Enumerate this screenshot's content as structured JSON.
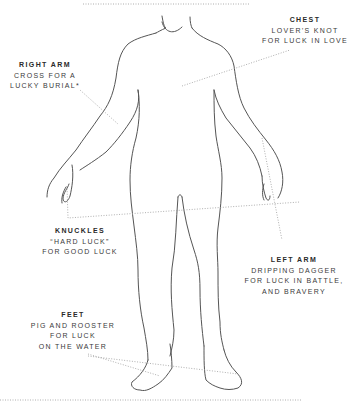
{
  "diagram": {
    "annotations": [
      {
        "id": "chest",
        "title": "CHEST",
        "lines": [
          "LOVER’S KNOT",
          "FOR LUCK IN LOVE"
        ]
      },
      {
        "id": "right-arm",
        "title": "RIGHT ARM",
        "lines": [
          "CROSS FOR A",
          "LUCKY BURIAL*"
        ]
      },
      {
        "id": "knuckles",
        "title": "KNUCKLES",
        "lines": [
          "“HARD LUCK”",
          "FOR GOOD LUCK"
        ]
      },
      {
        "id": "left-arm",
        "title": "LEFT ARM",
        "lines": [
          "DRIPPING DAGGER",
          "FOR LUCK IN BATTLE,",
          "AND BRAVERY"
        ]
      },
      {
        "id": "feet",
        "title": "FEET",
        "lines": [
          "PIG AND ROOSTER",
          "FOR LUCK",
          "ON THE WATER"
        ]
      }
    ],
    "colors": {
      "outline": "#555555",
      "leader": "#9a9a9a",
      "text": "#3a3a3a"
    }
  }
}
